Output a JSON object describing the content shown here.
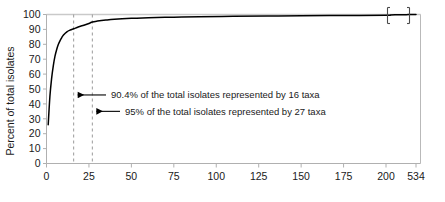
{
  "chart_data": {
    "type": "line",
    "title": "",
    "xlabel": "",
    "ylabel": "Percent of total isolates",
    "xlim": [
      0,
      534
    ],
    "ylim": [
      0,
      100
    ],
    "grid": false,
    "legend": "none",
    "x_ticks": [
      "0",
      "25",
      "50",
      "75",
      "100",
      "125",
      "150",
      "175",
      "200",
      "534"
    ],
    "x_tick_values": [
      0,
      25,
      50,
      75,
      100,
      125,
      150,
      175,
      200,
      534
    ],
    "y_ticks": [
      "0",
      "10",
      "20",
      "30",
      "40",
      "50",
      "60",
      "70",
      "80",
      "90",
      "100"
    ],
    "y_tick_values": [
      0,
      10,
      20,
      30,
      40,
      50,
      60,
      70,
      80,
      90,
      100
    ],
    "axis_break": {
      "present": true,
      "axis": "x",
      "between": [
        200,
        534
      ],
      "symbol": "double-slash-bracket"
    },
    "series": [
      {
        "name": "Cumulative percent of total isolates",
        "x": [
          1,
          2,
          3,
          4,
          5,
          6,
          7,
          8,
          9,
          10,
          12,
          14,
          16,
          18,
          20,
          22,
          25,
          27,
          30,
          35,
          40,
          50,
          60,
          75,
          90,
          110,
          130,
          150,
          175,
          200,
          250,
          300,
          350,
          400,
          450,
          500,
          534
        ],
        "y": [
          26.0,
          45.0,
          57.0,
          65.5,
          72.0,
          76.5,
          80.0,
          82.5,
          84.5,
          86.2,
          88.4,
          89.6,
          90.4,
          91.3,
          92.1,
          92.8,
          94.0,
          95.0,
          95.6,
          96.3,
          96.8,
          97.4,
          97.8,
          98.2,
          98.5,
          98.8,
          99.0,
          99.2,
          99.35,
          99.5,
          99.65,
          99.75,
          99.82,
          99.88,
          99.93,
          99.97,
          100.0
        ]
      }
    ],
    "reference_lines": [
      {
        "type": "vertical",
        "value": 16,
        "style": "dashed",
        "color": "#9a9a9a"
      },
      {
        "type": "vertical",
        "value": 27,
        "style": "dashed",
        "color": "#9a9a9a"
      },
      {
        "type": "horizontal",
        "value": 100,
        "style": "solid",
        "color": "#c9c9c9"
      }
    ],
    "annotations": [
      {
        "text": "90.4% of the total isolates represented by 16 taxa",
        "points_to_x": 16,
        "at_y": 46
      },
      {
        "text": "95% of the total isolates represented by 27 taxa",
        "points_to_x": 27,
        "at_y": 35
      }
    ]
  },
  "axis": {
    "y_title": "Percent of total isolates"
  },
  "colors": {
    "curve": "#000000",
    "axis": "#b0b0b0",
    "dashed": "#9a9a9a",
    "top_rule": "#c9c9c9",
    "text": "#1a1a1a"
  }
}
